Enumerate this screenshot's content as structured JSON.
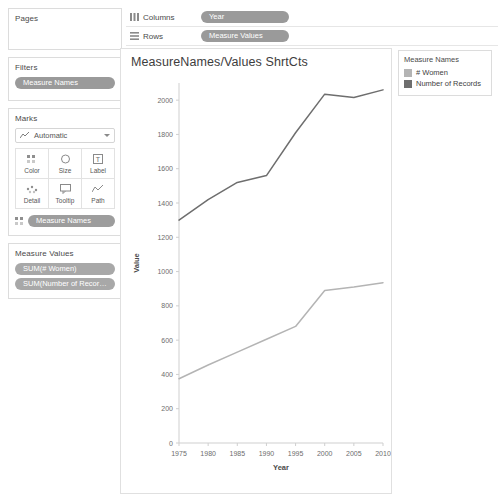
{
  "sidebar": {
    "pages": {
      "title": "Pages"
    },
    "filters": {
      "title": "Filters",
      "pills": [
        "Measure Names"
      ]
    },
    "marks": {
      "title": "Marks",
      "mark_type": "Automatic",
      "mark_type_icon": "line-chart-icon",
      "buttons": [
        {
          "label": "Color",
          "icon": "color-icon"
        },
        {
          "label": "Size",
          "icon": "size-icon"
        },
        {
          "label": "Label",
          "icon": "label-icon"
        },
        {
          "label": "Detail",
          "icon": "detail-icon"
        },
        {
          "label": "Tooltip",
          "icon": "tooltip-icon"
        },
        {
          "label": "Path",
          "icon": "path-icon"
        }
      ],
      "encoding_pills": [
        {
          "icon": "color-icon",
          "label": "Measure Names"
        }
      ]
    },
    "measure_values": {
      "title": "Measure Values",
      "pills": [
        "SUM(# Women)",
        "SUM(Number of Records)"
      ]
    }
  },
  "shelves": {
    "columns": {
      "label": "Columns",
      "icon": "columns-icon",
      "pill": "Year"
    },
    "rows": {
      "label": "Rows",
      "icon": "rows-icon",
      "pill": "Measure Values"
    }
  },
  "legend": {
    "title": "Measure Names",
    "entries": [
      {
        "label": "# Women",
        "color": "#b4b4b4"
      },
      {
        "label": "Number of Records",
        "color": "#6e6e6e"
      }
    ]
  },
  "worksheet": {
    "title": "MeasureNames/Values ShrtCts"
  },
  "chart_data": {
    "type": "line",
    "title": "MeasureNames/Values ShrtCts",
    "xlabel": "Year",
    "ylabel": "Value",
    "x": [
      1975,
      1980,
      1985,
      1990,
      1995,
      2000,
      2005,
      2010
    ],
    "xticks": [
      1975,
      1980,
      1985,
      1990,
      1995,
      2000,
      2005,
      2010
    ],
    "yticks": [
      0,
      200,
      400,
      600,
      800,
      1000,
      1200,
      1400,
      1600,
      1800,
      2000
    ],
    "xlim": [
      1975,
      2010
    ],
    "ylim": [
      0,
      2100
    ],
    "grid": false,
    "legend_position": "right",
    "series": [
      {
        "name": "Number of Records",
        "color": "#6e6e6e",
        "values": [
          1300,
          1420,
          1520,
          1560,
          1810,
          2035,
          2015,
          2060
        ]
      },
      {
        "name": "# Women",
        "color": "#b4b4b4",
        "values": [
          375,
          455,
          530,
          605,
          680,
          890,
          910,
          935
        ]
      }
    ]
  }
}
